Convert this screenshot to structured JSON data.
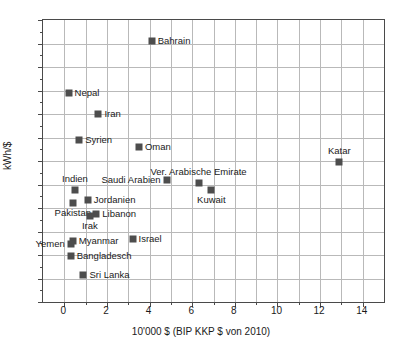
{
  "chart_data": {
    "type": "scatter",
    "title": "",
    "xlabel": "10'000 $ (BIP KKP $ von 2010)",
    "ylabel": "kWh/$",
    "xlim": [
      -1,
      15
    ],
    "ylim": [
      0.4,
      2.8
    ],
    "xticks": [
      0,
      2,
      4,
      6,
      8,
      10,
      12,
      14
    ],
    "xtick_labels": [
      "0",
      "2",
      "4",
      "6",
      "8",
      "10",
      "12",
      "14"
    ],
    "yticks": [
      0.4,
      0.6,
      0.8,
      1.0,
      1.2,
      1.4,
      1.6,
      1.8,
      2.0,
      2.2,
      2.4,
      2.6,
      2.8
    ],
    "ytick_labels": [
      "0.4",
      "0.6",
      "0.8",
      "1.0",
      "1.2",
      "1.4",
      "1.6",
      "1.8",
      "2.0",
      "2.2",
      "2.4",
      "2.6",
      "2.8"
    ],
    "grid": true,
    "legend": "none",
    "marker_color": "#4d4d4d",
    "marker": "square",
    "points": [
      {
        "label": "Bahrain",
        "x": 4.1,
        "y": 2.62,
        "label_pos": "right"
      },
      {
        "label": "Nepal",
        "x": 0.2,
        "y": 2.18,
        "label_pos": "right"
      },
      {
        "label": "Iran",
        "x": 1.6,
        "y": 2.0,
        "label_pos": "right"
      },
      {
        "label": "Syrien",
        "x": 0.7,
        "y": 1.78,
        "label_pos": "right"
      },
      {
        "label": "Oman",
        "x": 3.5,
        "y": 1.72,
        "label_pos": "right"
      },
      {
        "label": "Katar",
        "x": 12.9,
        "y": 1.59,
        "label_pos": "above"
      },
      {
        "label": "Saudi Arabien",
        "x": 4.8,
        "y": 1.44,
        "label_pos": "left"
      },
      {
        "label": "Ver. Arabische Emirate",
        "x": 6.3,
        "y": 1.41,
        "label_pos": "above"
      },
      {
        "label": "Kuwait",
        "x": 6.9,
        "y": 1.35,
        "label_pos": "below"
      },
      {
        "label": "Indien",
        "x": 0.5,
        "y": 1.35,
        "label_pos": "above"
      },
      {
        "label": "Jordanien",
        "x": 1.1,
        "y": 1.27,
        "label_pos": "right"
      },
      {
        "label": "Pakistan",
        "x": 0.4,
        "y": 1.24,
        "label_pos": "below"
      },
      {
        "label": "Libanon",
        "x": 1.5,
        "y": 1.15,
        "label_pos": "right"
      },
      {
        "label": "Irak",
        "x": 1.2,
        "y": 1.13,
        "label_pos": "below"
      },
      {
        "label": "Israel",
        "x": 3.2,
        "y": 0.94,
        "label_pos": "right"
      },
      {
        "label": "Myanmar",
        "x": 0.4,
        "y": 0.92,
        "label_pos": "right"
      },
      {
        "label": "Yemen",
        "x": 0.3,
        "y": 0.89,
        "label_pos": "left"
      },
      {
        "label": "Bangladesch",
        "x": 0.3,
        "y": 0.79,
        "label_pos": "right"
      },
      {
        "label": "Sri Lanka",
        "x": 0.9,
        "y": 0.63,
        "label_pos": "right"
      }
    ]
  }
}
